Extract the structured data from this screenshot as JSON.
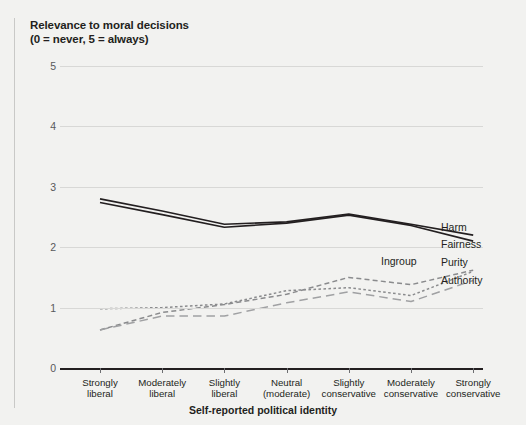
{
  "chart_data": {
    "type": "line",
    "title": "Relevance to moral decisions\n(0 = never, 5 = always)",
    "xlabel": "Self-reported political identity",
    "ylabel": "",
    "ylim": [
      0,
      5
    ],
    "yticks": [
      "0",
      "1",
      "2",
      "3",
      "4",
      "5"
    ],
    "grid": true,
    "legend_position": "inline-right",
    "categories": [
      "Strongly\nliberal",
      "Moderately\nliberal",
      "Slightly\nliberal",
      "Neutral\n(moderate)",
      "Slightly\nconservative",
      "Moderately\nconservative",
      "Strongly\nconservative"
    ],
    "series": [
      {
        "name": "Harm",
        "style": "solid",
        "color": "#231f20",
        "values": [
          2.8,
          2.6,
          2.38,
          2.42,
          2.55,
          2.38,
          2.2
        ]
      },
      {
        "name": "Fairness",
        "style": "solid",
        "color": "#231f20",
        "values": [
          2.74,
          2.54,
          2.33,
          2.4,
          2.53,
          2.36,
          2.1
        ]
      },
      {
        "name": "Ingroup",
        "style": "dashed",
        "color": "#8a8b8d",
        "values": [
          0.63,
          0.92,
          1.05,
          1.22,
          1.5,
          1.38,
          1.62
        ]
      },
      {
        "name": "Purity",
        "style": "dotted-dash",
        "color": "#8a8b8d",
        "values": [
          0.98,
          1.0,
          1.06,
          1.28,
          1.33,
          1.2,
          1.6
        ]
      },
      {
        "name": "Authority",
        "style": "long-dash",
        "color": "#a0a1a3",
        "values": [
          0.63,
          0.86,
          0.86,
          1.08,
          1.26,
          1.1,
          1.45
        ]
      }
    ],
    "series_labels": [
      {
        "name": "Harm",
        "x": 441,
        "y": 222
      },
      {
        "name": "Fairness",
        "x": 441,
        "y": 239
      },
      {
        "name": "Ingroup",
        "x": 381,
        "y": 256
      },
      {
        "name": "Purity",
        "x": 441,
        "y": 257
      },
      {
        "name": "Authority",
        "x": 441,
        "y": 275
      }
    ]
  }
}
